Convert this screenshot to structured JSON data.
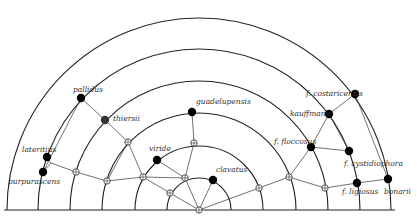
{
  "diagram": {
    "center": [
      199,
      210
    ],
    "baseline_y": 210,
    "radii": [
      32,
      64,
      97,
      129,
      161,
      192
    ],
    "colors": {
      "line": "#222222",
      "node": "#000000",
      "thiersii_node": "#333333",
      "background": "#ffffff"
    },
    "nodes": [
      {
        "id": "lateritius",
        "label": "lateritius",
        "x": 47,
        "y": 157,
        "type": "filled",
        "lx": 22,
        "ly": 152
      },
      {
        "id": "purpurascens",
        "label": "purpurascens",
        "x": 43,
        "y": 172,
        "type": "filled",
        "lx": 8,
        "ly": 184
      },
      {
        "id": "pallidus",
        "label": "pallidus",
        "x": 81,
        "y": 98,
        "type": "filled",
        "lx": 73,
        "ly": 92
      },
      {
        "id": "thiersii",
        "label": "thiersii",
        "x": 105,
        "y": 120,
        "type": "grey",
        "lx": 113,
        "ly": 121
      },
      {
        "id": "viride",
        "label": "viride",
        "x": 157,
        "y": 160,
        "type": "filled",
        "lx": 149,
        "ly": 151
      },
      {
        "id": "gundelupensis",
        "label": "guadelupensis",
        "x": 192,
        "y": 112,
        "type": "filled",
        "lx": 196,
        "ly": 104
      },
      {
        "id": "clavatus",
        "label": "clavatus",
        "x": 213,
        "y": 180,
        "type": "filled",
        "lx": 216,
        "ly": 172
      },
      {
        "id": "f_floccosus",
        "label": "f. floccosus",
        "x": 311,
        "y": 147,
        "type": "filled",
        "lx": 274,
        "ly": 144
      },
      {
        "id": "kauffmanii",
        "label": "kauffmanii",
        "x": 329,
        "y": 114,
        "type": "filled",
        "lx": 290,
        "ly": 116
      },
      {
        "id": "f_costaricensis",
        "label": "f. costaricensis",
        "x": 355,
        "y": 94,
        "type": "filled",
        "lx": 306,
        "ly": 96
      },
      {
        "id": "f_cystidiophora",
        "label": "f. cystidiophora",
        "x": 349,
        "y": 151,
        "type": "filled",
        "lx": 344,
        "ly": 166
      },
      {
        "id": "f_ligiosus",
        "label": "f. ligiosus",
        "x": 357,
        "y": 183,
        "type": "filled",
        "lx": 342,
        "ly": 194
      },
      {
        "id": "bonarii",
        "label": "bonarii",
        "x": 388,
        "y": 179,
        "type": "filled",
        "lx": 384,
        "ly": 194
      }
    ],
    "open_nodes": [
      {
        "id": "j_lat",
        "x": 51,
        "y": 163,
        "small": true
      },
      {
        "id": "o1",
        "x": 76,
        "y": 172
      },
      {
        "id": "o2",
        "x": 107,
        "y": 181
      },
      {
        "id": "o3",
        "x": 128,
        "y": 142
      },
      {
        "id": "o4",
        "x": 143,
        "y": 177
      },
      {
        "id": "o5",
        "x": 170,
        "y": 193
      },
      {
        "id": "o6",
        "x": 185,
        "y": 178
      },
      {
        "id": "o7",
        "x": 194,
        "y": 143
      },
      {
        "id": "center",
        "x": 199,
        "y": 210
      },
      {
        "id": "o8",
        "x": 259,
        "y": 188
      },
      {
        "id": "o9",
        "x": 289,
        "y": 177
      },
      {
        "id": "o10",
        "x": 325,
        "y": 188
      }
    ],
    "edges": [
      [
        "lateritius",
        "j_lat"
      ],
      [
        "purpurascens",
        "j_lat"
      ],
      [
        "j_lat",
        "o1"
      ],
      [
        "o1",
        "o2"
      ],
      [
        "o2",
        "o4"
      ],
      [
        "o4",
        "o6"
      ],
      [
        "pallidus",
        "thiersii"
      ],
      [
        "pallidus",
        "purpurascens"
      ],
      [
        "thiersii",
        "o3"
      ],
      [
        "o3",
        "o4"
      ],
      [
        "o3",
        "o2"
      ],
      [
        "viride",
        "o6"
      ],
      [
        "o4",
        "o5"
      ],
      [
        "o5",
        "center"
      ],
      [
        "o6",
        "center"
      ],
      [
        "o7",
        "o6"
      ],
      [
        "o7",
        "gundelupensis"
      ],
      [
        "clavatus",
        "center"
      ],
      [
        "center",
        "o8"
      ],
      [
        "o8",
        "o9"
      ],
      [
        "o9",
        "f_floccosus"
      ],
      [
        "o9",
        "o10"
      ],
      [
        "f_floccosus",
        "kauffmanii"
      ],
      [
        "kauffmanii",
        "f_costaricensis"
      ],
      [
        "f_floccosus",
        "f_cystidiophora"
      ],
      [
        "kauffmanii",
        "f_cystidiophora"
      ],
      [
        "o10",
        "f_ligiosus"
      ],
      [
        "f_ligiosus",
        "bonarii"
      ],
      [
        "f_costaricensis",
        "bonarii"
      ]
    ]
  }
}
